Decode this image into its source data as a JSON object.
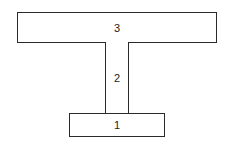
{
  "diagram": {
    "type": "stacked-blocks",
    "blocks": [
      {
        "id": "1",
        "label": "1",
        "position": "bottom"
      },
      {
        "id": "2",
        "label": "2",
        "position": "middle"
      },
      {
        "id": "3",
        "label": "3",
        "position": "top"
      }
    ],
    "colors": {
      "stroke": "#2b2b2b",
      "fill": "#ffffff",
      "text": "#222222"
    }
  }
}
